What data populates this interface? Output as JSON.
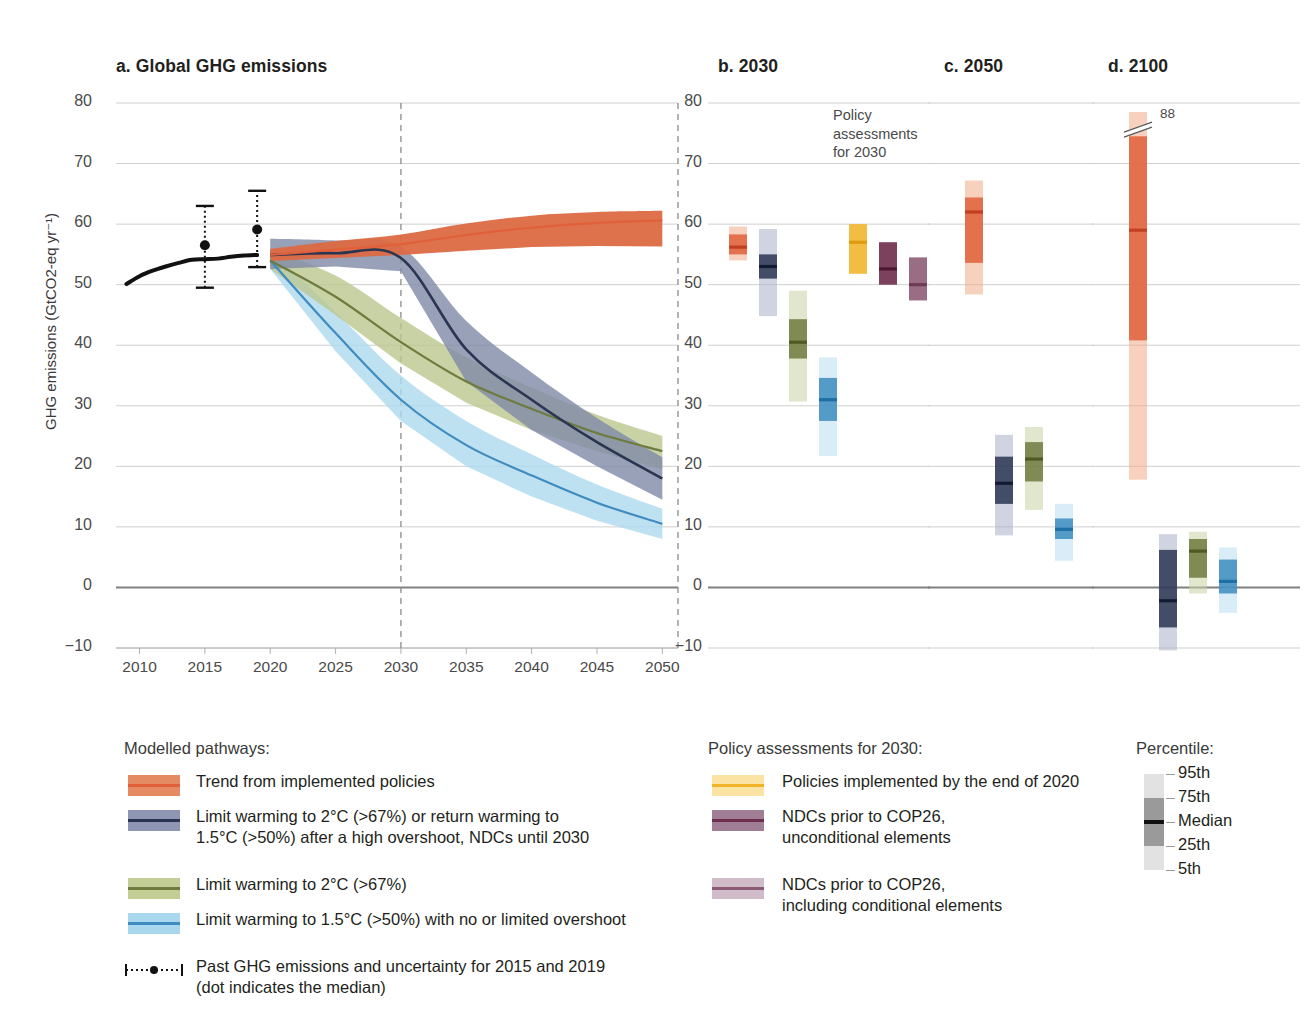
{
  "panels": {
    "a": {
      "title": "a. Global GHG emissions"
    },
    "b": {
      "title": "b. 2030",
      "annotation": "Policy\nassessments\nfor 2030"
    },
    "c": {
      "title": "c. 2050"
    },
    "d": {
      "title": "d. 2100",
      "break_value": "88"
    }
  },
  "axes": {
    "ylabel": "GHG emissions (GtCO2-eq yr⁻¹)",
    "yticks": [
      "80",
      "70",
      "60",
      "50",
      "40",
      "30",
      "20",
      "10",
      "0",
      "−10"
    ],
    "yvalues": [
      80,
      70,
      60,
      50,
      40,
      30,
      20,
      10,
      0,
      -10
    ],
    "xticks": [
      "2010",
      "2015",
      "2020",
      "2025",
      "2030",
      "2035",
      "2040",
      "2045",
      "2050"
    ],
    "xvalues": [
      2010,
      2015,
      2020,
      2025,
      2030,
      2035,
      2040,
      2045,
      2050
    ],
    "ylim": [
      -10,
      80
    ],
    "xlim": [
      2008,
      2051
    ]
  },
  "legend_pathways": {
    "heading": "Modelled pathways:",
    "items": [
      {
        "label": "Trend from implemented policies",
        "color": "#E1603A",
        "band": "#E58B63",
        "key": "trend"
      },
      {
        "label": "Limit warming to 2°C (>67%) or return warming to\n1.5°C (>50%) after a high overshoot, NDCs until 2030",
        "color": "#2A3551",
        "band": "#8E96B4",
        "key": "overshoot"
      },
      {
        "label": "Limit warming to 2°C (>67%)",
        "color": "#6E7A3E",
        "band": "#C3CE96",
        "key": "c2"
      },
      {
        "label": "Limit warming to 1.5°C (>50%) with no or limited overshoot",
        "color": "#3E8CC0",
        "band": "#A8D7EE",
        "key": "c15"
      }
    ],
    "past": {
      "label": "Past GHG emissions and uncertainty for 2015 and 2019\n(dot indicates the median)"
    }
  },
  "legend_policy": {
    "heading": "Policy assessments for 2030:",
    "items": [
      {
        "label": "Policies implemented by the end of 2020",
        "color": "#F0B429",
        "band": "#FBE3A4",
        "key": "pol2020"
      },
      {
        "label": "NDCs prior to COP26,\nunconditional elements",
        "color": "#6E2D4A",
        "band": "#A07E95",
        "key": "ndc_uncond"
      },
      {
        "label": "NDCs prior to COP26,\nincluding conditional elements",
        "color": "#8C5A74",
        "band": "#CFBCC8",
        "key": "ndc_cond"
      }
    ]
  },
  "legend_percentile": {
    "heading": "Percentile:",
    "items": [
      "95th",
      "75th",
      "Median",
      "25th",
      "5th"
    ]
  },
  "chart_data": {
    "type": "line",
    "xlabel": "",
    "ylabel": "GHG emissions (GtCO2-eq yr⁻¹)",
    "ylim": [
      -10,
      80
    ],
    "xlim": [
      2008,
      2051
    ],
    "grid": true,
    "legend_position": "below",
    "historical": {
      "name": "Past GHG emissions",
      "x": [
        2009,
        2010,
        2011,
        2012,
        2013,
        2014,
        2015,
        2016,
        2017,
        2018,
        2019
      ],
      "y": [
        50.1,
        51.4,
        52.3,
        53.0,
        53.6,
        54.1,
        54.2,
        54.3,
        54.6,
        54.8,
        54.9
      ]
    },
    "uncertainty_markers": [
      {
        "year": 2015,
        "median": 56.5,
        "low": 49.5,
        "high": 63.0
      },
      {
        "year": 2019,
        "median": 59.1,
        "low": 52.9,
        "high": 65.5
      }
    ],
    "series": [
      {
        "name": "Trend from implemented policies",
        "color": "#E1603A",
        "x": [
          2020,
          2025,
          2030,
          2035,
          2040,
          2045,
          2050
        ],
        "median": [
          54.9,
          55.8,
          56.7,
          58.2,
          59.4,
          60.2,
          60.6
        ],
        "low": [
          53.9,
          54.4,
          54.9,
          55.6,
          56.2,
          56.4,
          56.3
        ],
        "high": [
          55.9,
          57.2,
          58.3,
          60.1,
          61.4,
          62.0,
          62.2
        ]
      },
      {
        "name": "Limit warming to 2°C (>67%) or return warming to 1.5°C (>50%) after a high overshoot, NDCs until 2030",
        "color": "#2A3551",
        "x": [
          2020,
          2025,
          2030,
          2035,
          2040,
          2045,
          2050
        ],
        "median": [
          54.9,
          55.2,
          54.4,
          39.3,
          31.0,
          24.0,
          18.0
        ],
        "low": [
          52.6,
          53.0,
          52.2,
          34.0,
          26.0,
          20.0,
          14.5
        ],
        "high": [
          57.6,
          57.3,
          56.3,
          44.0,
          35.5,
          28.0,
          21.5
        ]
      },
      {
        "name": "Limit warming to 2°C (>67%)",
        "color": "#6E7A3E",
        "x": [
          2020,
          2025,
          2030,
          2035,
          2040,
          2045,
          2050
        ],
        "median": [
          54.0,
          48.0,
          40.5,
          34.0,
          29.5,
          25.5,
          22.5
        ],
        "low": [
          52.6,
          45.0,
          37.0,
          30.5,
          26.0,
          22.5,
          19.5
        ],
        "high": [
          55.8,
          51.5,
          44.5,
          38.0,
          33.0,
          28.5,
          25.0
        ]
      },
      {
        "name": "Limit warming to 1.5°C (>50%) with no or limited overshoot",
        "color": "#3E8CC0",
        "x": [
          2020,
          2025,
          2030,
          2035,
          2040,
          2045,
          2050
        ],
        "median": [
          54.0,
          42.0,
          31.0,
          23.5,
          18.5,
          14.0,
          10.5
        ],
        "low": [
          52.6,
          39.0,
          27.5,
          20.0,
          15.0,
          11.0,
          8.0
        ],
        "high": [
          55.8,
          45.5,
          35.0,
          27.5,
          22.0,
          17.0,
          13.0
        ]
      }
    ],
    "panel_b_2030": {
      "title": "b. 2030",
      "bars": [
        {
          "key": "trend",
          "label": "Trend from implemented policies",
          "color": "#E1603A",
          "band": "#F0A989",
          "p5": 54.0,
          "p25": 55.0,
          "median": 56.2,
          "p75": 58.3,
          "p95": 59.6
        },
        {
          "key": "overshoot",
          "label": "Limit warming to 2°C (>67%) / high overshoot NDCs until 2030",
          "color": "#2A3551",
          "band": "#A9B1C9",
          "p5": 44.8,
          "p25": 51.0,
          "median": 53.0,
          "p75": 55.0,
          "p95": 59.2
        },
        {
          "key": "c2",
          "label": "Limit warming to 2°C (>67%)",
          "color": "#6E7A3E",
          "band": "#C9D3A4",
          "p5": 30.7,
          "p25": 37.8,
          "median": 40.5,
          "p75": 44.3,
          "p95": 49.0
        },
        {
          "key": "c15",
          "label": "Limit warming to 1.5°C (>50%) with no or limited overshoot",
          "color": "#3E8CC0",
          "band": "#B8DEF1",
          "p5": 21.7,
          "p25": 27.5,
          "median": 31.0,
          "p75": 34.6,
          "p95": 38.0
        },
        {
          "key": "pol2020",
          "label": "Policies implemented by the end of 2020",
          "color": "#F0B429",
          "band": "#FBE3A4",
          "p5": 51.8,
          "p25": 51.8,
          "median": 57.0,
          "p75": 60.0,
          "p95": 60.0
        },
        {
          "key": "ndc_uncond",
          "label": "NDCs prior to COP26, unconditional elements",
          "color": "#6E2D4A",
          "band": "#A07E95",
          "p5": 50.0,
          "p25": 50.0,
          "median": 52.6,
          "p75": 57.0,
          "p95": 57.0
        },
        {
          "key": "ndc_cond",
          "label": "NDCs prior to COP26, including conditional elements",
          "color": "#8C5A74",
          "band": "#CFBCC8",
          "p5": 47.4,
          "p25": 47.4,
          "median": 50.0,
          "p75": 54.5,
          "p95": 54.5
        }
      ]
    },
    "panel_c_2050": {
      "title": "c. 2050",
      "bars": [
        {
          "key": "trend",
          "label": "Trend from implemented policies",
          "color": "#E1603A",
          "band": "#F0A989",
          "p5": 48.4,
          "p25": 53.6,
          "median": 62.0,
          "p75": 64.4,
          "p95": 67.2
        },
        {
          "key": "overshoot",
          "label": "Limit warming to 2°C (>67%) / high overshoot NDCs until 2030",
          "color": "#2A3551",
          "band": "#A9B1C9",
          "p5": 8.6,
          "p25": 13.8,
          "median": 17.2,
          "p75": 21.6,
          "p95": 25.2
        },
        {
          "key": "c2",
          "label": "Limit warming to 2°C (>67%)",
          "color": "#6E7A3E",
          "band": "#C9D3A4",
          "p5": 12.8,
          "p25": 17.5,
          "median": 21.2,
          "p75": 24.0,
          "p95": 26.5
        },
        {
          "key": "c15",
          "label": "Limit warming to 1.5°C (>50%) with no or limited overshoot",
          "color": "#3E8CC0",
          "band": "#B8DEF1",
          "p5": 4.4,
          "p25": 8.0,
          "median": 9.6,
          "p75": 11.4,
          "p95": 13.8
        }
      ]
    },
    "panel_d_2100": {
      "title": "d. 2100",
      "axis_break": {
        "at": 76.5,
        "value": 88,
        "label": "88"
      },
      "bars": [
        {
          "key": "trend",
          "label": "Trend from implemented policies",
          "color": "#E1603A",
          "band": "#F0A989",
          "p5": 17.8,
          "p25": 40.8,
          "median": 59.0,
          "p75": 74.5,
          "p95": 88.0
        },
        {
          "key": "overshoot",
          "label": "Limit warming to 2°C (>67%) / high overshoot NDCs until 2030",
          "color": "#2A3551",
          "band": "#A9B1C9",
          "p5": -10.4,
          "p25": -6.6,
          "median": -2.2,
          "p75": 6.2,
          "p95": 8.8
        },
        {
          "key": "c2",
          "label": "Limit warming to 2°C (>67%)",
          "color": "#6E7A3E",
          "band": "#C9D3A4",
          "p5": -1.0,
          "p25": 1.6,
          "median": 6.0,
          "p75": 8.0,
          "p95": 9.2
        },
        {
          "key": "c15",
          "label": "Limit warming to 1.5°C (>50%) with no or limited overshoot",
          "color": "#3E8CC0",
          "band": "#B8DEF1",
          "p5": -4.2,
          "p25": -1.0,
          "median": 1.0,
          "p75": 4.6,
          "p95": 6.6
        }
      ]
    }
  }
}
